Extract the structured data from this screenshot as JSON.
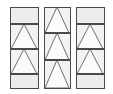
{
  "figure": {
    "canvas": {
      "width": 113,
      "height": 94,
      "background": "#ffffff"
    },
    "style": {
      "panel_fill": "#ececec",
      "band_fill": "#f2f2f2",
      "triangle_fill": "#fbfbfb",
      "stroke": "#6f6f6f",
      "stroke_dark": "#4a4a4a",
      "stroke_width": 1,
      "divider_width": 1.4
    },
    "columns": [
      {
        "name": "column-left",
        "x": 10,
        "y": 7,
        "width": 28,
        "height": 81,
        "dividers": [
          24,
          49,
          74
        ],
        "bands": [
          {
            "name": "band-empty-top",
            "top": 7,
            "bottom": 24,
            "shape": "none"
          },
          {
            "name": "band-triangle-1",
            "top": 24,
            "bottom": 49,
            "shape": "triangle-up"
          },
          {
            "name": "band-triangle-2",
            "top": 49,
            "bottom": 74,
            "shape": "triangle-up"
          },
          {
            "name": "band-empty-bottom",
            "top": 74,
            "bottom": 88,
            "shape": "none"
          }
        ]
      },
      {
        "name": "column-middle",
        "x": 44,
        "y": 7,
        "width": 26,
        "height": 81,
        "dividers": [
          33,
          60
        ],
        "bands": [
          {
            "name": "band-triangle-1",
            "top": 7,
            "bottom": 33,
            "shape": "triangle-up"
          },
          {
            "name": "band-triangle-2",
            "top": 33,
            "bottom": 60,
            "shape": "triangle-up"
          },
          {
            "name": "band-triangle-3",
            "top": 60,
            "bottom": 88,
            "shape": "triangle-up"
          }
        ]
      },
      {
        "name": "column-right",
        "x": 76,
        "y": 7,
        "width": 28,
        "height": 81,
        "dividers": [
          24,
          49,
          74
        ],
        "bands": [
          {
            "name": "band-empty-top",
            "top": 7,
            "bottom": 24,
            "shape": "none"
          },
          {
            "name": "band-triangle-1",
            "top": 24,
            "bottom": 49,
            "shape": "triangle-up"
          },
          {
            "name": "band-triangle-2",
            "top": 49,
            "bottom": 74,
            "shape": "triangle-up"
          },
          {
            "name": "band-empty-bottom",
            "top": 74,
            "bottom": 88,
            "shape": "none"
          }
        ]
      }
    ]
  }
}
